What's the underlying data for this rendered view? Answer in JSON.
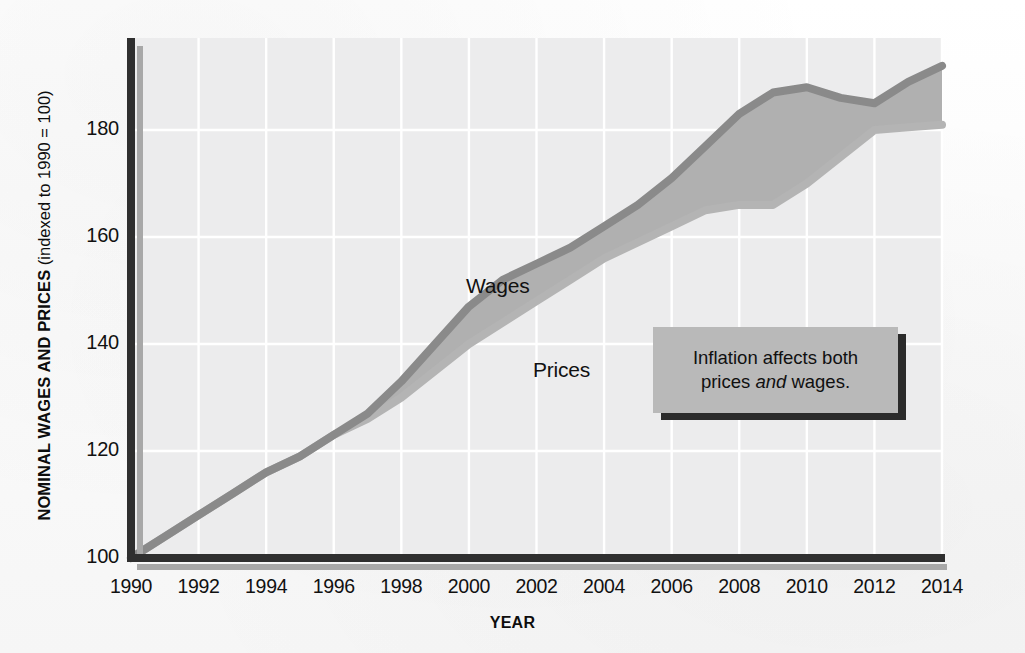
{
  "axes": {
    "y_title_bold": "NOMINAL WAGES AND PRICES",
    "y_title_paren": " (indexed to 1990 = 100)",
    "x_title": "YEAR"
  },
  "labels": {
    "wages": "Wages",
    "prices": "Prices"
  },
  "callout": {
    "line1": "Inflation affects both",
    "line2_pre": "prices ",
    "line2_em": "and",
    "line2_post": " wages."
  },
  "colors": {
    "plot_background": "#ececed",
    "gridline": "#ffffff",
    "axis": "#2f2f2f",
    "axis_shadow": "#9a9a9a",
    "band_fill": "#b0b0b0",
    "wages_stroke": "#8a8a8a",
    "prices_stroke": "#b4b4b4",
    "callout_fill": "#b9b9b9",
    "callout_shadow": "#2b2b2b",
    "text": "#111111"
  },
  "chart_data": {
    "type": "area",
    "title": "",
    "xlabel": "YEAR",
    "ylabel": "NOMINAL WAGES AND PRICES (indexed to 1990 = 100)",
    "xlim": [
      1990,
      2014
    ],
    "ylim": [
      100,
      191
    ],
    "grid": true,
    "legend": "inline-labels",
    "ytick_values": [
      100,
      120,
      140,
      160,
      180
    ],
    "ytick_labels": [
      "100",
      "120",
      "140",
      "160",
      "180"
    ],
    "xtick_values": [
      1990,
      1992,
      1994,
      1996,
      1998,
      2000,
      2002,
      2004,
      2006,
      2008,
      2010,
      2012,
      2014
    ],
    "xtick_labels": [
      "1990",
      "1992",
      "1994",
      "1996",
      "1998",
      "2000",
      "2002",
      "2004",
      "2006",
      "2008",
      "2010",
      "2012",
      "2014"
    ],
    "x": [
      1990,
      1991,
      1992,
      1993,
      1994,
      1995,
      1996,
      1997,
      1998,
      1999,
      2000,
      2001,
      2002,
      2003,
      2004,
      2005,
      2006,
      2007,
      2008,
      2009,
      2010,
      2011,
      2012,
      2013,
      2014
    ],
    "series": [
      {
        "name": "Wages",
        "color": "#8a8a8a",
        "values": [
          100,
          104,
          108,
          112,
          116,
          119,
          123,
          127,
          133,
          140,
          147,
          152,
          155,
          158,
          162,
          166,
          171,
          177,
          183,
          187,
          188,
          186,
          185,
          189,
          192
        ]
      },
      {
        "name": "Prices",
        "color": "#b4b4b4",
        "values": [
          100,
          104,
          108,
          112,
          116,
          119,
          123,
          126,
          130,
          135,
          140,
          144,
          148,
          152,
          156,
          159,
          162,
          165,
          166,
          166,
          170,
          175,
          180,
          180.5,
          181
        ]
      }
    ],
    "annotations": [
      {
        "text": "Inflation affects both prices and wages.",
        "emphasis": "and",
        "x": 2008.5,
        "y": 153
      }
    ]
  }
}
